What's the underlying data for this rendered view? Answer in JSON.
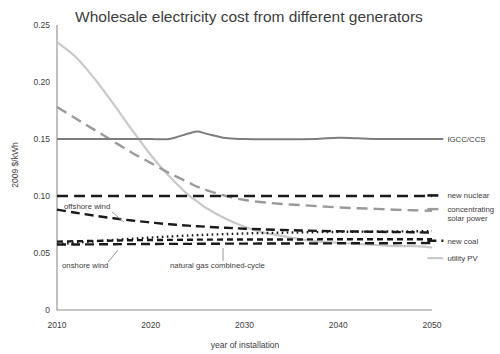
{
  "chart_data": {
    "type": "line",
    "title": "Wholesale electricity cost from different generators",
    "xlabel": "year of installation",
    "ylabel": "2009 $/kWh",
    "xlim": [
      2010,
      2050
    ],
    "ylim": [
      0,
      0.25
    ],
    "xticks": [
      "2010",
      "2020",
      "2030",
      "2040",
      "2050"
    ],
    "xtick_values": [
      2010,
      2020,
      2030,
      2040,
      2050
    ],
    "yticks": [
      "0",
      "0.05",
      "0.10",
      "0.15",
      "0.20",
      "0.25"
    ],
    "ytick_values": [
      0,
      0.05,
      0.1,
      0.15,
      0.2,
      0.25
    ],
    "grid": false,
    "legend_position": "right-inline",
    "x": [
      2010,
      2012,
      2014,
      2016,
      2018,
      2020,
      2022,
      2024,
      2025,
      2026,
      2028,
      2030,
      2032,
      2034,
      2036,
      2038,
      2040,
      2042,
      2044,
      2046,
      2048,
      2050
    ],
    "series": [
      {
        "name": "utility PV",
        "label": "utility PV",
        "color": "#c9c9c9",
        "width": 2.2,
        "dash": "none",
        "label_x": 2051,
        "label_y": 0.0455,
        "values": [
          0.235,
          0.222,
          0.203,
          0.181,
          0.158,
          0.136,
          0.117,
          0.101,
          0.095,
          0.089,
          0.08,
          0.073,
          0.068,
          0.065,
          0.062,
          0.06,
          0.059,
          0.058,
          0.057,
          0.056,
          0.056,
          0.055
        ]
      },
      {
        "name": "concentrating solar power",
        "label": "concentrating solar power",
        "color": "#9a9a9a",
        "width": 2.4,
        "dash": "11,6",
        "label_x": 2051,
        "label_y": 0.0885,
        "values": [
          0.178,
          0.168,
          0.158,
          0.148,
          0.138,
          0.129,
          0.12,
          0.112,
          0.108,
          0.105,
          0.1,
          0.0965,
          0.0945,
          0.093,
          0.092,
          0.091,
          0.09,
          0.0893,
          0.0887,
          0.088,
          0.0875,
          0.087
        ]
      },
      {
        "name": "IGCC/CCS",
        "label": "IGCC/CCS",
        "color": "#7d7d7d",
        "width": 2.0,
        "dash": "none",
        "label_x": 2051,
        "label_y": 0.15,
        "values": [
          0.15,
          0.15,
          0.15,
          0.15,
          0.15,
          0.15,
          0.15,
          0.1548,
          0.1565,
          0.1545,
          0.1508,
          0.15,
          0.1498,
          0.1497,
          0.1498,
          0.1502,
          0.1512,
          0.1506,
          0.15,
          0.1499,
          0.1499,
          0.1499
        ]
      },
      {
        "name": "new nuclear",
        "label": "new nuclear",
        "color": "#1a1a1a",
        "width": 2.6,
        "dash": "11,6",
        "label_x": 2051,
        "label_y": 0.1005,
        "values": [
          0.1,
          0.1,
          0.1,
          0.1,
          0.1,
          0.1,
          0.1,
          0.1,
          0.1,
          0.1,
          0.1,
          0.1,
          0.1,
          0.1,
          0.1,
          0.1,
          0.1,
          0.1,
          0.1,
          0.1,
          0.1,
          0.1
        ]
      },
      {
        "name": "offshore wind",
        "label": "offshore wind",
        "color": "#1a1a1a",
        "width": 2.4,
        "dash": "9,5",
        "annotation": true,
        "values": [
          0.088,
          0.0853,
          0.0828,
          0.0805,
          0.0785,
          0.0768,
          0.0752,
          0.074,
          0.0735,
          0.073,
          0.0721,
          0.0713,
          0.0707,
          0.0702,
          0.0698,
          0.0694,
          0.0691,
          0.0688,
          0.0686,
          0.0684,
          0.0682,
          0.068
        ]
      },
      {
        "name": "natural gas combined-cycle",
        "label": "natural gas combined-cycle",
        "color": "#1a1a1a",
        "width": 2.4,
        "dash": "1.6,3.4",
        "annotation": true,
        "values": [
          0.0578,
          0.059,
          0.0602,
          0.0614,
          0.0625,
          0.0636,
          0.0645,
          0.0653,
          0.0657,
          0.066,
          0.0666,
          0.0671,
          0.0675,
          0.0678,
          0.0681,
          0.0683,
          0.0685,
          0.0687,
          0.0688,
          0.0689,
          0.069,
          0.0691
        ]
      },
      {
        "name": "onshore wind",
        "label": "onshore wind",
        "color": "#1a1a1a",
        "width": 2.4,
        "dash": "6,4",
        "annotation": true,
        "values": [
          0.06,
          0.0603,
          0.0606,
          0.0609,
          0.0612,
          0.0614,
          0.0615,
          0.0616,
          0.0617,
          0.0617,
          0.0618,
          0.0618,
          0.0619,
          0.0619,
          0.0619,
          0.062,
          0.062,
          0.062,
          0.062,
          0.062,
          0.062,
          0.062
        ]
      },
      {
        "name": "new coal",
        "label": "new coal",
        "color": "#1a1a1a",
        "width": 2.4,
        "dash": "9,5",
        "label_x": 2051,
        "label_y": 0.0608,
        "values": [
          0.0575,
          0.0575,
          0.0576,
          0.0577,
          0.0578,
          0.0579,
          0.058,
          0.058,
          0.0581,
          0.0581,
          0.0582,
          0.0582,
          0.0583,
          0.0583,
          0.0584,
          0.0584,
          0.0585,
          0.0585,
          0.0586,
          0.0586,
          0.0587,
          0.0587
        ]
      }
    ],
    "annotations": [
      {
        "name": "offshore-wind",
        "text": "offshore wind",
        "text_x": 64,
        "text_y": 209,
        "leader": "M 112,212 L 124,222"
      },
      {
        "name": "onshore-wind",
        "text": "onshore wind",
        "text_x": 62,
        "text_y": 268,
        "leader": "M 108,262 L 118,250"
      },
      {
        "name": "natural-gas-combined-cycle",
        "text": "natural gas combined-cycle",
        "text_x": 170,
        "text_y": 268,
        "leader": "M 223,261 L 223,248"
      }
    ]
  }
}
